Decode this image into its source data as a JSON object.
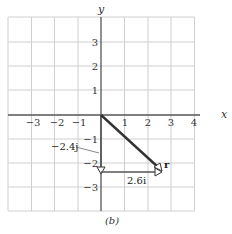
{
  "figure": {
    "caption": "(b)",
    "axes": {
      "x_label": "x",
      "y_label": "y",
      "x_ticks": [
        "−3",
        "−2",
        "−1",
        "1",
        "2",
        "3",
        "4"
      ],
      "y_ticks_positive": [
        "1",
        "2",
        "3"
      ],
      "y_ticks_negative": [
        "−1",
        "−2",
        "−3"
      ]
    },
    "vectors": {
      "r_label": "r",
      "r_components": {
        "x": 2.6,
        "y": -2.4
      },
      "x_component_label": "2.6i",
      "y_component_label": "−2.4j"
    },
    "colors": {
      "grid": "#c8c8c8",
      "axes": "#555555",
      "vector": "#333333"
    }
  }
}
